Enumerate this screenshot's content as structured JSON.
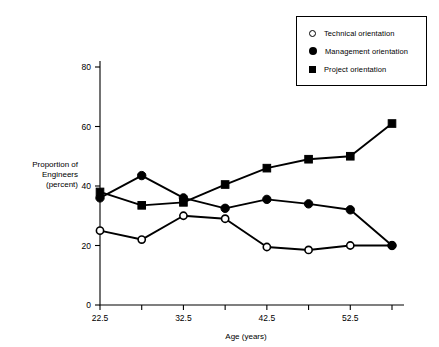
{
  "chart_data": {
    "type": "line",
    "title": "",
    "xlabel": "Age (years)",
    "ylabel": "Proportion of Engineers (percent)",
    "ylabel_lines": [
      "Proportion of",
      "Engineers",
      "(percent)"
    ],
    "x": [
      22.5,
      27.5,
      32.5,
      37.5,
      42.5,
      47.5,
      52.5,
      57.5
    ],
    "xtick_labels": [
      "22.5",
      "",
      "32.5",
      "",
      "42.5",
      "",
      "52.5",
      ""
    ],
    "xlim": [
      20.0,
      60.0
    ],
    "ylim": [
      0,
      80
    ],
    "yticks": [
      0,
      20,
      40,
      60,
      80
    ],
    "ytick_labels": [
      "0",
      "20",
      "40",
      "60",
      "80"
    ],
    "grid": false,
    "legend_position": "top-right",
    "series": [
      {
        "name": "Technical orientation",
        "marker": "open-circle",
        "values": [
          25,
          22,
          30,
          29,
          19.5,
          18.5,
          20,
          20
        ]
      },
      {
        "name": "Management orientation",
        "marker": "filled-circle",
        "values": [
          36,
          43.5,
          36,
          32.5,
          35.5,
          34,
          32,
          20
        ]
      },
      {
        "name": "Project orientation",
        "marker": "filled-square",
        "values": [
          38,
          33.5,
          34.5,
          40.5,
          46,
          49,
          50,
          61
        ]
      }
    ]
  },
  "legend": {
    "items": [
      {
        "label": "Technical orientation",
        "marker": "open-circle"
      },
      {
        "label": "Management orientation",
        "marker": "filled-circle"
      },
      {
        "label": "Project orientation",
        "marker": "filled-square"
      }
    ]
  },
  "colors": {
    "ink": "#000000",
    "background": "#ffffff"
  }
}
